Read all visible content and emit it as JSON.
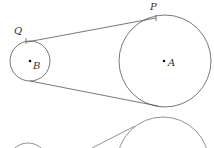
{
  "diagram": {
    "type": "two circles with external tangent lines (belt/pulley)",
    "stroke_color": "#555555",
    "circles": [
      {
        "label": "A",
        "cx": 165,
        "cy": 61,
        "r": 46
      },
      {
        "label": "B",
        "cx": 30,
        "cy": 61,
        "r": 20
      }
    ],
    "points": [
      {
        "label": "P",
        "x": 156,
        "y": 18,
        "label_x": 150,
        "label_y": 9
      },
      {
        "label": "Q",
        "x": 27,
        "y": 42,
        "label_x": 14,
        "label_y": 34
      }
    ],
    "center_labels": {
      "A": "A",
      "B": "B"
    },
    "point_labels": {
      "P": "P",
      "Q": "Q"
    }
  }
}
